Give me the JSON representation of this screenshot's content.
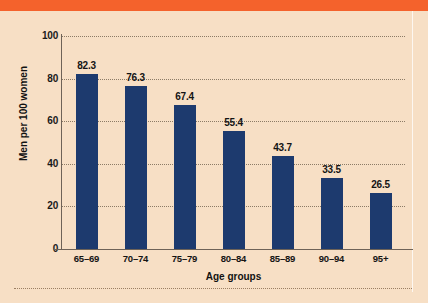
{
  "figure": {
    "background_color": "#f7dfc5",
    "band_color": "#f4622c",
    "bar_color": "#1d3a6e",
    "axis_color": "#6e6257",
    "grid_color": "#7a6a56"
  },
  "chart_data": {
    "type": "bar",
    "title": "",
    "subtitle": "",
    "xlabel": "Age groups",
    "ylabel": "Men per 100 women",
    "categories": [
      "65–69",
      "70–74",
      "75–79",
      "80–84",
      "85–89",
      "90–94",
      "95+"
    ],
    "values": [
      82.3,
      76.3,
      67.4,
      55.4,
      43.7,
      33.5,
      26.5
    ],
    "value_labels": [
      "82.3",
      "76.3",
      "67.4",
      "55.4",
      "43.7",
      "33.5",
      "26.5"
    ],
    "ylim": [
      0,
      100
    ],
    "yticks": [
      0,
      20,
      40,
      60,
      80,
      100
    ],
    "ytick_labels": [
      "0",
      "20",
      "40",
      "60",
      "80",
      "100"
    ],
    "grid": "horizontal-dotted",
    "legend": "none",
    "series": [
      {
        "name": "Sex ratio",
        "values": [
          82.3,
          76.3,
          67.4,
          55.4,
          43.7,
          33.5,
          26.5
        ]
      }
    ]
  }
}
